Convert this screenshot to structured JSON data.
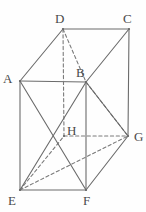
{
  "figure": {
    "kind": "geometry-diagram",
    "stroke_color": "#6b6b6b",
    "dashed_color": "#7a7a7a",
    "label_color": "#4a4a4a",
    "background": "#fefefe",
    "width": 146,
    "height": 212
  },
  "vertices": [
    {
      "id": "A",
      "label": "A",
      "x": 20,
      "y": 81,
      "label_x": 3,
      "label_y": 72,
      "hidden": false
    },
    {
      "id": "B",
      "label": "B",
      "x": 86,
      "y": 82,
      "label_x": 76,
      "label_y": 66,
      "hidden": false
    },
    {
      "id": "C",
      "label": "C",
      "x": 129,
      "y": 29,
      "label_x": 123,
      "label_y": 12,
      "hidden": false
    },
    {
      "id": "D",
      "label": "D",
      "x": 63,
      "y": 29,
      "label_x": 55,
      "label_y": 12,
      "hidden": false
    },
    {
      "id": "E",
      "label": "E",
      "x": 20,
      "y": 190,
      "label_x": 8,
      "label_y": 194,
      "hidden": false
    },
    {
      "id": "F",
      "label": "F",
      "x": 86,
      "y": 190,
      "label_x": 83,
      "label_y": 194,
      "hidden": false
    },
    {
      "id": "G",
      "label": "G",
      "x": 128,
      "y": 136,
      "label_x": 134,
      "label_y": 130,
      "hidden": false
    },
    {
      "id": "H",
      "label": "H",
      "x": 64,
      "y": 136,
      "label_x": 67,
      "label_y": 124,
      "hidden": true
    }
  ],
  "edges": [
    {
      "from": "D",
      "to": "C",
      "style": "solid",
      "name": "edge-dc"
    },
    {
      "from": "D",
      "to": "A",
      "style": "solid",
      "name": "edge-da"
    },
    {
      "from": "A",
      "to": "B",
      "style": "solid",
      "name": "edge-ab"
    },
    {
      "from": "B",
      "to": "C",
      "style": "solid",
      "name": "edge-bc"
    },
    {
      "from": "A",
      "to": "E",
      "style": "solid",
      "name": "edge-ae"
    },
    {
      "from": "B",
      "to": "F",
      "style": "solid",
      "name": "edge-bf"
    },
    {
      "from": "C",
      "to": "G",
      "style": "solid",
      "name": "edge-cg"
    },
    {
      "from": "E",
      "to": "F",
      "style": "solid",
      "name": "edge-ef"
    },
    {
      "from": "F",
      "to": "G",
      "style": "solid",
      "name": "edge-fg"
    },
    {
      "from": "D",
      "to": "H",
      "style": "dashed",
      "name": "edge-dh"
    },
    {
      "from": "E",
      "to": "H",
      "style": "dashed",
      "name": "edge-eh"
    },
    {
      "from": "H",
      "to": "G",
      "style": "dashed",
      "name": "edge-hg"
    },
    {
      "from": "D",
      "to": "B",
      "style": "dashed",
      "name": "diagonal-db"
    },
    {
      "from": "B",
      "to": "G",
      "style": "dashed",
      "name": "diagonal-bg"
    },
    {
      "from": "E",
      "to": "G",
      "style": "dashed",
      "name": "diagonal-eg"
    },
    {
      "from": "A",
      "to": "F",
      "style": "solid",
      "name": "diagonal-af"
    },
    {
      "from": "E",
      "to": "B",
      "style": "solid",
      "name": "diagonal-eb"
    },
    {
      "from": "B",
      "to": "G",
      "style": "solid",
      "name": "diagonal-bg-solid"
    }
  ]
}
